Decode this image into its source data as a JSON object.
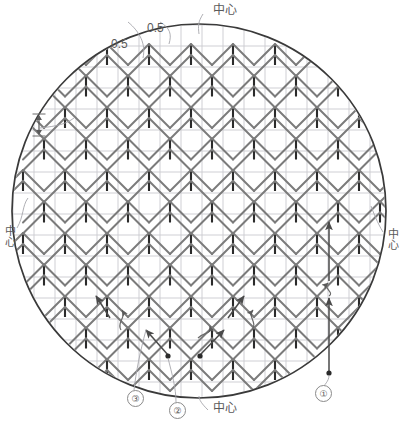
{
  "diagram": {
    "type": "knitting-chart-circle",
    "title_visible": false,
    "circle": {
      "cx": 199,
      "cy": 211,
      "r": 187,
      "stroke": "#3a3a3a"
    },
    "grid": {
      "cell": 21.0,
      "color": "#c9c9cf",
      "origin_x": 13,
      "origin_y": 25
    },
    "symbol_colors": {
      "stem": "#2b2b2b",
      "chevron": "#7b7b7b",
      "arrow": "#555555",
      "leader": "#9a9a9a"
    }
  },
  "labels": {
    "top_left_half": "0.5",
    "top_right_half": "0.5",
    "top_center": "中心",
    "left_center": "中心",
    "right_center": "中心",
    "bottom_center": "中心"
  },
  "callouts": [
    {
      "id": "mark-1",
      "text": "①",
      "x": 315,
      "y": 372
    },
    {
      "id": "mark-2",
      "text": "②",
      "x": 170,
      "y": 410
    },
    {
      "id": "mark-3",
      "text": "③",
      "x": 127,
      "y": 398
    }
  ],
  "icons": {
    "row_height_indicator": "up-down-arrow-icon"
  },
  "chart_data": {
    "type": "table",
    "columns": 18,
    "rows": 18,
    "cell_size": 21,
    "stem_columns_even": [
      1,
      3,
      5,
      7,
      9,
      11,
      13,
      15,
      17
    ],
    "repeat": "2 columns x 2 rows offset",
    "grid": true,
    "legend": [
      "0.5",
      "0.5",
      "中心"
    ]
  }
}
